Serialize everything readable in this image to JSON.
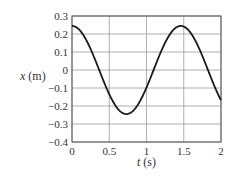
{
  "chart_data": {
    "type": "line",
    "title": "",
    "xlabel": "t (s)",
    "ylabel": "x (m)",
    "xlabel_var": "t",
    "xlabel_unit": "(s)",
    "ylabel_var": "x",
    "ylabel_unit": "(m)",
    "xlim": [
      0,
      2
    ],
    "ylim": [
      -0.4,
      0.3
    ],
    "grid": true,
    "legend": null,
    "x_ticks": [
      "0",
      "0.5",
      "1",
      "1.5",
      "2"
    ],
    "y_ticks": [
      "0.3",
      "0.2",
      "0.1",
      "0",
      "-0.1",
      "-0.2",
      "-0.3",
      "-0.4"
    ],
    "series": [
      {
        "name": "x(t)",
        "description": "x = 0.25 cos(2.9 t - 0.05) approx; amplitude 0.25 m, period ~1.46 s",
        "x": [
          0,
          0.1,
          0.2,
          0.3,
          0.4,
          0.5,
          0.6,
          0.7,
          0.73,
          0.8,
          0.9,
          1.0,
          1.1,
          1.2,
          1.3,
          1.4,
          1.46,
          1.5,
          1.6,
          1.7,
          1.8,
          1.9,
          2.0
        ],
        "values": [
          0.245,
          0.228,
          0.175,
          0.095,
          0.0,
          -0.095,
          -0.18,
          -0.235,
          -0.25,
          -0.238,
          -0.19,
          -0.11,
          -0.015,
          0.08,
          0.17,
          0.23,
          0.245,
          0.243,
          0.21,
          0.13,
          0.04,
          -0.07,
          -0.18
        ]
      }
    ]
  },
  "style": {
    "line_color": "#1a1a1a",
    "grid_color": "#9a9a9a",
    "frame_color": "#555555"
  }
}
